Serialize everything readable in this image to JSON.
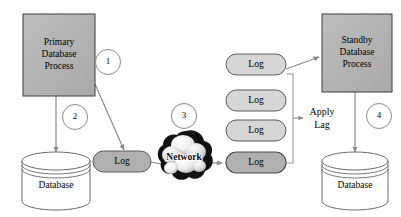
{
  "diagram": {
    "colors": {
      "process_fill": "#b3b3b3",
      "process_stroke": "#3d3d3d",
      "pill_fill_active": "#b0b0b0",
      "pill_fill_queued": "#d6d6d6",
      "pill_stroke": "#5a5a5a",
      "cylinder_fill": "#ffffff",
      "cylinder_stroke": "#5a5a5a",
      "cloud_dark": "#111111",
      "cloud_light": "#e8e8e8",
      "arrow": "#808080",
      "circle_stroke": "#8a8a8a",
      "text": "#000000"
    },
    "nodes": {
      "primary_process": {
        "name": "primary-database-process",
        "lines": [
          "Primary",
          "Database",
          "Process"
        ]
      },
      "standby_process": {
        "name": "standby-database-process",
        "lines": [
          "Standby",
          "Database",
          "Process"
        ]
      },
      "primary_database": {
        "name": "primary-database-cylinder",
        "label": "Database"
      },
      "standby_database": {
        "name": "standby-database-cylinder",
        "label": "Database"
      },
      "network_cloud": {
        "name": "network-cloud",
        "label": "Network"
      },
      "source_log": {
        "name": "source-log-pill",
        "label": "Log"
      },
      "log_queue": [
        {
          "label": "Log",
          "state": "queued"
        },
        {
          "label": "Log",
          "state": "queued"
        },
        {
          "label": "Log",
          "state": "queued"
        },
        {
          "label": "Log",
          "state": "active"
        }
      ],
      "apply_lag": {
        "name": "apply-lag-label",
        "lines": [
          "Apply",
          "Lag"
        ]
      }
    },
    "step_markers": [
      {
        "id": "step-1",
        "label": "1"
      },
      {
        "id": "step-2",
        "label": "2"
      },
      {
        "id": "step-3",
        "label": "3"
      },
      {
        "id": "step-4",
        "label": "4"
      }
    ]
  }
}
